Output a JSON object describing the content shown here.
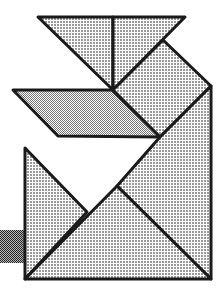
{
  "figure": {
    "colors": {
      "background": "#ffffff",
      "outline": "#1a1a1a",
      "fill_light": "#c8c8c8",
      "fill_dark": "#5a5a5a"
    },
    "pieces": [
      {
        "name": "top-left-triangle",
        "points": "38,17 113,17 113,90"
      },
      {
        "name": "top-right-triangle",
        "points": "113,17 185,17 113,90"
      },
      {
        "name": "square",
        "points": "113,90 163,40 211,86 160,137"
      },
      {
        "name": "parallelogram",
        "points": "13,90 112,90 160,137 58,136"
      },
      {
        "name": "right-mid-triangle",
        "points": "211,86 211,279 117,186 160,137"
      },
      {
        "name": "left-small-triangle",
        "points": "25,148 87,212 25,279"
      },
      {
        "name": "bottom-large-triangle",
        "points": "25,279 117,186 211,279"
      },
      {
        "name": "dark-square",
        "points": "0,230 25,230 25,263 0,263"
      }
    ]
  }
}
